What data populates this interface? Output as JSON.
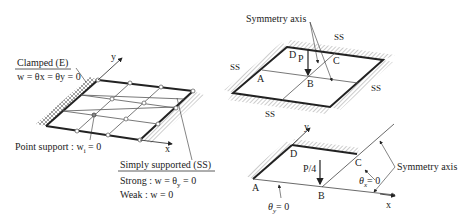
{
  "left_figure": {
    "clamped_title": "Clamped (E)",
    "clamped_eq": "w = θx = θy = 0",
    "point_support": "Point support : w",
    "point_support_sub": "i",
    "point_support_tail": " = 0",
    "ss_title": "Simply supported (SS)",
    "ss_strong": "Strong : w = θ",
    "ss_strong_sub": "y",
    "ss_strong_tail": " = 0",
    "ss_weak": "Weak :  w = 0",
    "axis_x": "x",
    "axis_y": "y"
  },
  "top_right_figure": {
    "symmetry_label": "Symmetry axis",
    "ss_top": "SS",
    "ss_left": "SS",
    "ss_right": "SS",
    "ss_bottom": "SS",
    "load": "P",
    "points": [
      "A",
      "B",
      "C",
      "D"
    ]
  },
  "bottom_right_figure": {
    "load": "P/4",
    "points": [
      "A",
      "B",
      "C",
      "D"
    ],
    "theta_x": "θ",
    "theta_x_sub": "x",
    "theta_x_tail": "= 0",
    "theta_y": "θ",
    "theta_y_sub": "y",
    "theta_y_tail": "= 0",
    "symmetry_label": "Symmetry axis",
    "axis_x": "x",
    "axis_y": "y"
  }
}
